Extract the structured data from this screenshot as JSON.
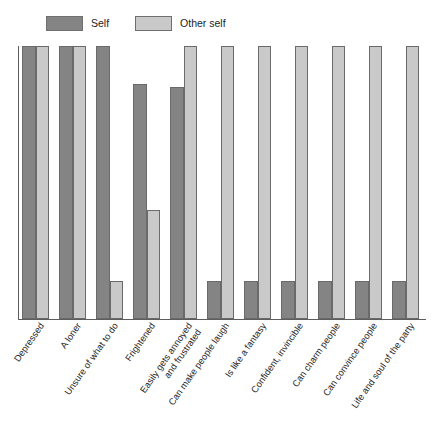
{
  "legend": {
    "position": "top-left",
    "entries": [
      {
        "label": "Self",
        "color": "#848484"
      },
      {
        "label": "Other self",
        "color": "#c9c9c9"
      }
    ]
  },
  "chart_data": {
    "type": "bar",
    "title": "",
    "subtitle": "",
    "xlabel": "",
    "ylabel": "",
    "ylim": [
      0,
      100
    ],
    "grid": false,
    "legend_position": "top-left",
    "categories": [
      "Depressed",
      "A loner",
      "Unsure of what to do",
      "Frightened",
      "Easily gets annoyed and frustrated",
      "Can make people laugh",
      "Is like a fantasy",
      "Confident, invincible",
      "Can charm people",
      "Can convince people",
      "Life and soul of the party"
    ],
    "category_lines": [
      [
        "Depressed"
      ],
      [
        "A loner"
      ],
      [
        "Unsure of what to do"
      ],
      [
        "Frightened"
      ],
      [
        "Easily gets annoyed",
        "and frustrated"
      ],
      [
        "Can make people laugh"
      ],
      [
        "Is like a fantasy"
      ],
      [
        "Confident, invincible"
      ],
      [
        "Can charm people"
      ],
      [
        "Can convince people"
      ],
      [
        "Life and soul of the party"
      ]
    ],
    "series": [
      {
        "name": "Self",
        "color": "#848484",
        "values": [
          100,
          100,
          100,
          86,
          85,
          14,
          14,
          14,
          14,
          14,
          14
        ]
      },
      {
        "name": "Other self",
        "color": "#c9c9c9",
        "values": [
          100,
          100,
          14,
          40,
          100,
          100,
          100,
          100,
          100,
          100,
          100
        ]
      }
    ]
  }
}
